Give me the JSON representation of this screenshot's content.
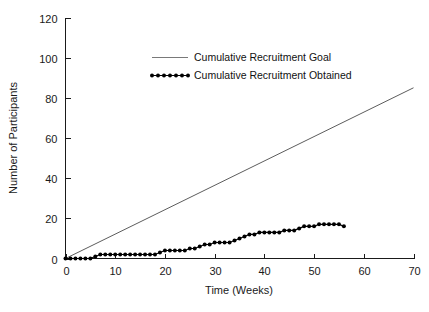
{
  "chart_data": {
    "type": "line",
    "title": "",
    "xlabel": "Time (Weeks)",
    "ylabel": "Number of Participants",
    "xlim": [
      0,
      70
    ],
    "ylim": [
      0,
      120
    ],
    "xticks": [
      0,
      10,
      20,
      30,
      40,
      50,
      60,
      70
    ],
    "yticks": [
      0,
      20,
      40,
      60,
      80,
      100,
      120
    ],
    "grid": false,
    "legend_position": "upper-center",
    "series": [
      {
        "name": "Cumulative Recruitment Goal",
        "style": "solid-line",
        "marker": "none",
        "color": "#4a4a4a",
        "x": [
          0,
          70
        ],
        "values": [
          0,
          85
        ]
      },
      {
        "name": "Cumulative Recruitment Obtained",
        "style": "solid-line-with-markers",
        "marker": "filled-circle",
        "color": "#000000",
        "x": [
          0,
          1,
          2,
          3,
          4,
          5,
          6,
          7,
          8,
          9,
          10,
          11,
          12,
          13,
          14,
          15,
          16,
          17,
          18,
          19,
          20,
          21,
          22,
          23,
          24,
          25,
          26,
          27,
          28,
          29,
          30,
          31,
          32,
          33,
          34,
          35,
          36,
          37,
          38,
          39,
          40,
          41,
          42,
          43,
          44,
          45,
          46,
          47,
          48,
          49,
          50,
          51,
          52,
          53,
          54,
          55,
          56
        ],
        "values": [
          0,
          0,
          0,
          0,
          0,
          0,
          1,
          2,
          2,
          2,
          2,
          2,
          2,
          2,
          2,
          2,
          2,
          2,
          2,
          3,
          4,
          4,
          4,
          4,
          4,
          5,
          5,
          6,
          7,
          7,
          8,
          8,
          8,
          8,
          9,
          10,
          11,
          12,
          12,
          13,
          13,
          13,
          13,
          13,
          14,
          14,
          14,
          15,
          16,
          16,
          16,
          17,
          17,
          17,
          17,
          17,
          16
        ]
      }
    ]
  },
  "legend": {
    "items": [
      {
        "label": "Cumulative Recruitment Goal"
      },
      {
        "label": "Cumulative Recruitment Obtained"
      }
    ]
  },
  "axes": {
    "y_title": "Number of Participants",
    "x_title": "Time (Weeks)",
    "y_tick_labels": [
      "0",
      "20",
      "40",
      "60",
      "80",
      "100",
      "120"
    ],
    "x_tick_labels": [
      "0",
      "10",
      "20",
      "30",
      "40",
      "50",
      "60",
      "70"
    ]
  },
  "colors": {
    "goal": "#4a4a4a",
    "obtained": "#000000",
    "axis": "#1a1a1a",
    "background": "#ffffff"
  }
}
